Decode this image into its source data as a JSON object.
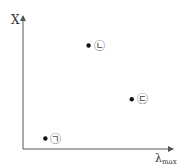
{
  "chart_data": {
    "type": "scatter",
    "title": "",
    "xlabel": "λ",
    "xlabel_sub": "max",
    "ylabel": "X",
    "xlim": [
      0,
      10
    ],
    "ylim": [
      0,
      10
    ],
    "grid": false,
    "ticks": false,
    "points": [
      {
        "label": "㉡",
        "x": 4.4,
        "y": 7.9
      },
      {
        "label": "㉢",
        "x": 7.3,
        "y": 3.8
      },
      {
        "label": "㉠",
        "x": 1.5,
        "y": 0.8
      }
    ]
  }
}
